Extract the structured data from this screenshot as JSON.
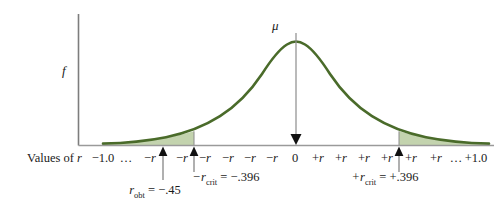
{
  "figure": {
    "y_axis_label": "f",
    "mean_label": "μ",
    "axis_caption": "Values of r",
    "colors": {
      "curve": "#4a6b2a",
      "shading": "#c3d3ae",
      "axis": "#8a8a8a",
      "arrow": "#1a1a1a",
      "background": "#ffffff"
    }
  },
  "tick_labels": [
    {
      "text": "−1.0",
      "x": 103
    },
    {
      "text": "…",
      "x": 126
    },
    {
      "text": "−r",
      "x": 150
    },
    {
      "text": "−r",
      "x": 182
    },
    {
      "text": "−r",
      "x": 205
    },
    {
      "text": "−r",
      "x": 228
    },
    {
      "text": "−r",
      "x": 250
    },
    {
      "text": "−r",
      "x": 272
    },
    {
      "text": "0",
      "x": 295
    },
    {
      "text": "+r",
      "x": 318
    },
    {
      "text": "+r",
      "x": 341
    },
    {
      "text": "+r",
      "x": 364
    },
    {
      "text": "+r",
      "x": 387
    },
    {
      "text": "+r",
      "x": 411
    },
    {
      "text": "+r",
      "x": 436
    },
    {
      "text": "…",
      "x": 456
    },
    {
      "text": "+1.0",
      "x": 476
    }
  ],
  "annotations": {
    "r_obt": {
      "symbol": "r",
      "subscript": "obt",
      "equals": " = −.45",
      "arrow_x": 163,
      "label_x": 155
    },
    "r_crit_neg": {
      "symbol": "−r",
      "subscript": "crit",
      "equals": " = −.396",
      "arrow_x": 194,
      "label_x": 226
    },
    "r_crit_pos": {
      "symbol": "+r",
      "subscript": "crit",
      "equals": " = +.396",
      "arrow_x": 399,
      "label_x": 385
    }
  },
  "chart_data": {
    "type": "line",
    "xlabel": "Values of r",
    "ylabel": "f",
    "xlim": [
      -1.0,
      1.0
    ],
    "grid": false,
    "legend": "none",
    "mean": 0,
    "critical_values": [
      -0.396,
      0.396
    ],
    "observed_value": -0.45,
    "shaded_regions": [
      {
        "name": "lower-rejection-region",
        "from": -1.0,
        "to": -0.396
      },
      {
        "name": "upper-rejection-region",
        "from": 0.396,
        "to": 1.0
      }
    ]
  }
}
